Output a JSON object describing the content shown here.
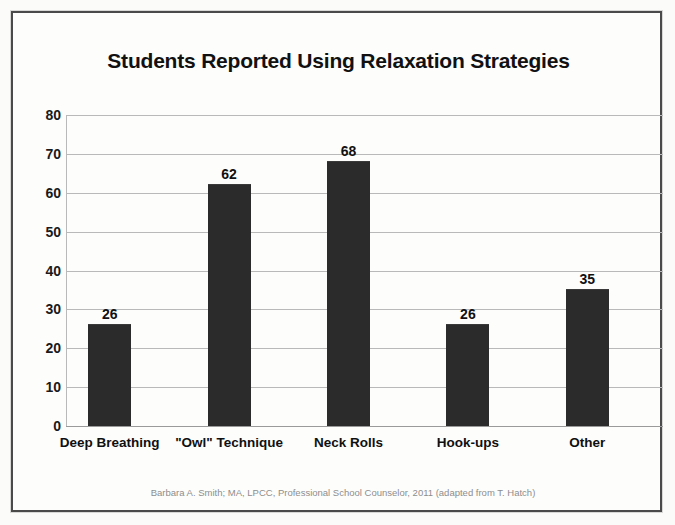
{
  "chart_data": {
    "type": "bar",
    "title": "Students Reported Using Relaxation Strategies",
    "categories": [
      "Deep Breathing",
      "\"Owl\" Technique",
      "Neck Rolls",
      "Hook-ups",
      "Other"
    ],
    "values": [
      26,
      62,
      68,
      26,
      35
    ],
    "xlabel": "",
    "ylabel": "",
    "ylim": [
      0,
      80
    ],
    "ytick_labels": [
      "80",
      "70",
      "60",
      "50",
      "40",
      "30",
      "20",
      "10",
      "0"
    ],
    "ytick_values": [
      80,
      70,
      60,
      50,
      40,
      30,
      20,
      10,
      0
    ],
    "grid": true,
    "legend": "none",
    "data_labels": true,
    "bar_color": "#2b2b2b",
    "grid_color": "#b9b9b9",
    "text_color": "#111111",
    "background_color": "#fdfdfc",
    "border_color": "#4a4a4a",
    "footer_color": "#8d8d8d",
    "annotation": "Barbara A. Smith; MA, LPCC, Professional School Counselor, 2011 (adapted from T. Hatch)"
  }
}
